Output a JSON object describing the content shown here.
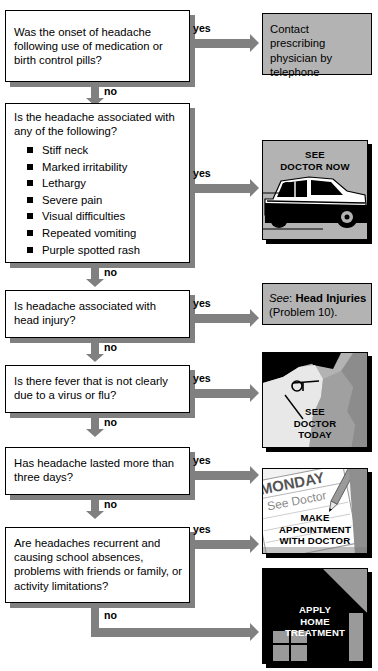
{
  "flowchart": {
    "title": "Headache decision flowchart",
    "yes_label": "yes",
    "no_label": "no",
    "colors": {
      "box_fill": "#ffffff",
      "outcome_fill": "#b3b3b3",
      "shadow": "#808080",
      "arrow": "#808080",
      "border": "#000000",
      "illustration_dark": "#000000",
      "illustration_gray": "#b3b3b3"
    },
    "nodes": [
      {
        "id": "q1",
        "question": "Was the onset of headache following use of medication or birth control pills?",
        "yes_label": "yes",
        "no_label": "no"
      },
      {
        "id": "q2",
        "question": "Is the headache associated with any of the following?",
        "symptoms": [
          "Stiff neck",
          "Marked irritability",
          "Lethargy",
          "Severe pain",
          "Visual difficulties",
          "Repeated vomiting",
          "Purple spotted rash"
        ],
        "yes_label": "yes",
        "no_label": "no"
      },
      {
        "id": "q3",
        "question": "Is headache associated with head injury?",
        "yes_label": "yes",
        "no_label": "no"
      },
      {
        "id": "q4",
        "question": "Is there fever that is not clearly due to a virus or flu?",
        "yes_label": "yes",
        "no_label": "no"
      },
      {
        "id": "q5",
        "question": "Has headache lasted more than three days?",
        "yes_label": "yes",
        "no_label": "no"
      },
      {
        "id": "q6",
        "question": "Are headaches recurrent and causing school absences, problems with friends or family, or activity limitations?",
        "yes_label": "yes",
        "no_label": "no"
      }
    ],
    "outcomes": [
      {
        "id": "o1",
        "kind": "text-box",
        "text": "Contact prescribing physician by telephone"
      },
      {
        "id": "o2",
        "kind": "illustration",
        "caption_line1": "SEE",
        "caption_line2": "DOCTOR NOW",
        "image_name": "car-driving-to-doctor-illustration"
      },
      {
        "id": "o3",
        "kind": "text-box",
        "see_prefix": "See",
        "colon": ":",
        "reference": "Head Injuries",
        "problem": "(Problem 10)."
      },
      {
        "id": "o4",
        "kind": "illustration",
        "caption_line1": "SEE",
        "caption_line2": "DOCTOR",
        "caption_line3": "TODAY",
        "image_name": "feverish-child-profile-illustration"
      },
      {
        "id": "o5",
        "kind": "illustration",
        "calendar_day": "MONDAY",
        "calendar_note": "See Doctor",
        "caption_line1": "MAKE",
        "caption_line2": "APPOINTMENT",
        "caption_line3": "WITH DOCTOR",
        "image_name": "calendar-with-pencil-illustration"
      },
      {
        "id": "o6",
        "kind": "illustration",
        "caption_line1": "APPLY",
        "caption_line2": "HOME",
        "caption_line3": "TREATMENT",
        "image_name": "house-illustration"
      }
    ]
  }
}
